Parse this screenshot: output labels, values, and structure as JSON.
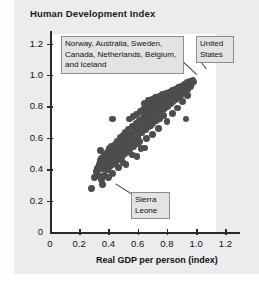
{
  "figure": {
    "title": "Human Development Index",
    "background_color": "#ececec",
    "plot_background_color": "#ffffff",
    "dot_color": "#4d4d4d",
    "axis_color": "#2a2a2a",
    "callout_fill": "#e3e3e3",
    "callout_border": "#8d8d8d"
  },
  "annotations": {
    "top_nations": "Norway, Australia, Sweden, Canada, Netherlands, Belgium, and Iceland",
    "united_states": "United States",
    "sierra_leone": "Sierra Leone"
  },
  "chart_data": {
    "type": "scatter",
    "title": "Human Development Index",
    "xlabel": "Real GDP per person (index)",
    "ylabel": "Human Development Index",
    "xlim": [
      0,
      1.3
    ],
    "ylim": [
      0,
      1.28
    ],
    "xticks": [
      0,
      0.2,
      0.4,
      0.6,
      0.8,
      1.0,
      1.2
    ],
    "xtick_labels": [
      "0",
      "0.2",
      "0.4",
      "0.6",
      "0.8",
      "1.0",
      "1.2"
    ],
    "yticks": [
      0,
      0.2,
      0.4,
      0.6,
      0.8,
      1.0,
      1.2
    ],
    "ytick_labels": [
      "0",
      "0.2",
      "0.4",
      "0.6",
      "0.8",
      "1.0",
      "1.2"
    ],
    "grid": false,
    "legend": false,
    "annotations": [
      {
        "text": "Norway, Australia, Sweden, Canada, Netherlands, Belgium, and Iceland",
        "points_to": [
          0.95,
          0.96
        ]
      },
      {
        "text": "United States",
        "points_to": [
          0.97,
          0.95
        ]
      },
      {
        "text": "Sierra Leone",
        "points_to": [
          0.285,
          0.275
        ]
      }
    ],
    "points": [
      [
        0.285,
        0.275
      ],
      [
        0.305,
        0.345
      ],
      [
        0.315,
        0.385
      ],
      [
        0.322,
        0.405
      ],
      [
        0.33,
        0.36
      ],
      [
        0.335,
        0.43
      ],
      [
        0.34,
        0.405
      ],
      [
        0.345,
        0.455
      ],
      [
        0.35,
        0.335
      ],
      [
        0.352,
        0.47
      ],
      [
        0.36,
        0.405
      ],
      [
        0.362,
        0.44
      ],
      [
        0.37,
        0.49
      ],
      [
        0.373,
        0.36
      ],
      [
        0.38,
        0.425
      ],
      [
        0.385,
        0.465
      ],
      [
        0.39,
        0.51
      ],
      [
        0.392,
        0.395
      ],
      [
        0.398,
        0.445
      ],
      [
        0.402,
        0.48
      ],
      [
        0.405,
        0.53
      ],
      [
        0.41,
        0.415
      ],
      [
        0.415,
        0.455
      ],
      [
        0.418,
        0.495
      ],
      [
        0.422,
        0.545
      ],
      [
        0.425,
        0.72
      ],
      [
        0.43,
        0.43
      ],
      [
        0.435,
        0.475
      ],
      [
        0.44,
        0.515
      ],
      [
        0.445,
        0.56
      ],
      [
        0.45,
        0.445
      ],
      [
        0.455,
        0.49
      ],
      [
        0.458,
        0.53
      ],
      [
        0.462,
        0.58
      ],
      [
        0.468,
        0.46
      ],
      [
        0.472,
        0.505
      ],
      [
        0.478,
        0.55
      ],
      [
        0.482,
        0.6
      ],
      [
        0.488,
        0.475
      ],
      [
        0.492,
        0.52
      ],
      [
        0.497,
        0.565
      ],
      [
        0.5,
        0.615
      ],
      [
        0.505,
        0.49
      ],
      [
        0.508,
        0.535
      ],
      [
        0.512,
        0.585
      ],
      [
        0.518,
        0.635
      ],
      [
        0.522,
        0.505
      ],
      [
        0.528,
        0.555
      ],
      [
        0.532,
        0.6
      ],
      [
        0.538,
        0.655
      ],
      [
        0.542,
        0.72
      ],
      [
        0.548,
        0.525
      ],
      [
        0.552,
        0.57
      ],
      [
        0.558,
        0.62
      ],
      [
        0.562,
        0.67
      ],
      [
        0.568,
        0.735
      ],
      [
        0.572,
        0.545
      ],
      [
        0.578,
        0.59
      ],
      [
        0.582,
        0.64
      ],
      [
        0.588,
        0.69
      ],
      [
        0.592,
        0.75
      ],
      [
        0.598,
        0.565
      ],
      [
        0.602,
        0.61
      ],
      [
        0.608,
        0.66
      ],
      [
        0.612,
        0.71
      ],
      [
        0.618,
        0.765
      ],
      [
        0.622,
        0.53
      ],
      [
        0.628,
        0.63
      ],
      [
        0.632,
        0.68
      ],
      [
        0.638,
        0.73
      ],
      [
        0.642,
        0.78
      ],
      [
        0.648,
        0.82
      ],
      [
        0.652,
        0.65
      ],
      [
        0.658,
        0.7
      ],
      [
        0.662,
        0.75
      ],
      [
        0.668,
        0.795
      ],
      [
        0.672,
        0.835
      ],
      [
        0.678,
        0.67
      ],
      [
        0.682,
        0.72
      ],
      [
        0.688,
        0.765
      ],
      [
        0.692,
        0.805
      ],
      [
        0.698,
        0.845
      ],
      [
        0.702,
        0.69
      ],
      [
        0.708,
        0.74
      ],
      [
        0.712,
        0.78
      ],
      [
        0.718,
        0.82
      ],
      [
        0.722,
        0.855
      ],
      [
        0.728,
        0.71
      ],
      [
        0.732,
        0.755
      ],
      [
        0.738,
        0.795
      ],
      [
        0.742,
        0.835
      ],
      [
        0.748,
        0.865
      ],
      [
        0.752,
        0.725
      ],
      [
        0.758,
        0.77
      ],
      [
        0.762,
        0.81
      ],
      [
        0.768,
        0.845
      ],
      [
        0.772,
        0.875
      ],
      [
        0.778,
        0.74
      ],
      [
        0.782,
        0.785
      ],
      [
        0.788,
        0.82
      ],
      [
        0.792,
        0.855
      ],
      [
        0.798,
        0.885
      ],
      [
        0.802,
        0.8
      ],
      [
        0.808,
        0.835
      ],
      [
        0.812,
        0.865
      ],
      [
        0.818,
        0.89
      ],
      [
        0.822,
        0.815
      ],
      [
        0.828,
        0.845
      ],
      [
        0.832,
        0.875
      ],
      [
        0.838,
        0.9
      ],
      [
        0.842,
        0.83
      ],
      [
        0.848,
        0.86
      ],
      [
        0.852,
        0.885
      ],
      [
        0.858,
        0.91
      ],
      [
        0.862,
        0.845
      ],
      [
        0.868,
        0.87
      ],
      [
        0.872,
        0.895
      ],
      [
        0.878,
        0.92
      ],
      [
        0.882,
        0.86
      ],
      [
        0.888,
        0.885
      ],
      [
        0.892,
        0.905
      ],
      [
        0.898,
        0.93
      ],
      [
        0.902,
        0.875
      ],
      [
        0.908,
        0.9
      ],
      [
        0.912,
        0.92
      ],
      [
        0.918,
        0.94
      ],
      [
        0.922,
        0.89
      ],
      [
        0.928,
        0.915
      ],
      [
        0.932,
        0.935
      ],
      [
        0.938,
        0.95
      ],
      [
        0.942,
        0.905
      ],
      [
        0.948,
        0.93
      ],
      [
        0.952,
        0.945
      ],
      [
        0.958,
        0.96
      ],
      [
        0.962,
        0.925
      ],
      [
        0.968,
        0.945
      ],
      [
        0.972,
        0.958
      ],
      [
        0.978,
        0.965
      ],
      [
        0.985,
        0.955
      ],
      [
        0.93,
        0.72
      ],
      [
        0.645,
        0.535
      ],
      [
        0.69,
        0.675
      ],
      [
        0.595,
        0.48
      ],
      [
        0.47,
        0.41
      ],
      [
        0.43,
        0.37
      ],
      [
        0.36,
        0.3
      ],
      [
        0.345,
        0.52
      ],
      [
        0.4,
        0.345
      ],
      [
        0.52,
        0.43
      ],
      [
        0.5,
        0.445
      ],
      [
        0.565,
        0.49
      ],
      [
        0.615,
        0.575
      ],
      [
        0.66,
        0.595
      ],
      [
        0.7,
        0.62
      ],
      [
        0.745,
        0.66
      ],
      [
        0.8,
        0.705
      ],
      [
        0.84,
        0.755
      ],
      [
        0.875,
        0.79
      ],
      [
        0.905,
        0.83
      ],
      [
        0.94,
        0.87
      ]
    ]
  }
}
